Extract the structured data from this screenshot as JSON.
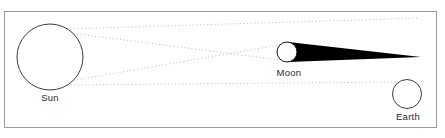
{
  "figure": {
    "background_color": "#ffffff",
    "frame_color": "#9a9a9a",
    "width": 445,
    "height": 138
  },
  "labels": {
    "sun": "Sun",
    "moon": "Moon",
    "earth": "Earth"
  },
  "bodies": [
    {
      "key": "sun",
      "label": "Sun",
      "shape": "circle",
      "cx": 50,
      "cy": 57,
      "r": 33,
      "fill": "#ffffff",
      "stroke": "#3c3c3c",
      "label_x": 50,
      "label_y": 101
    },
    {
      "key": "moon",
      "label": "Moon",
      "shape": "circle",
      "cx": 287,
      "cy": 52,
      "r": 10,
      "fill": "#ffffff",
      "stroke": "#111111",
      "label_x": 289,
      "label_y": 76
    },
    {
      "key": "earth",
      "label": "Earth",
      "shape": "circle",
      "cx": 407,
      "cy": 94,
      "r": 14.5,
      "fill": "#ffffff",
      "stroke": "#3c3c3c",
      "label_x": 408,
      "label_y": 120
    }
  ],
  "umbra": {
    "name": "moon-shadow-cone",
    "fill": "#000000",
    "apex_x": 421,
    "apex_y": 57,
    "base_top_x": 288,
    "base_top_y": 42,
    "base_bottom_x": 288,
    "base_bottom_y": 62
  },
  "rays": {
    "style": "dotted",
    "color": "#b9b9b9",
    "dash": "1,2.6",
    "width": 1,
    "lines": [
      {
        "name": "penumbra-ray-upper-outer",
        "x1": 67,
        "y1": 29,
        "x2": 420,
        "y2": 18
      },
      {
        "name": "umbra-ray-upper",
        "x1": 70,
        "y1": 33,
        "x2": 296,
        "y2": 62
      },
      {
        "name": "umbra-ray-lower",
        "x1": 70,
        "y1": 81,
        "x2": 296,
        "y2": 42
      },
      {
        "name": "penumbra-ray-lower-outer",
        "x1": 67,
        "y1": 85,
        "x2": 396,
        "y2": 82
      }
    ]
  },
  "frame": {
    "x": 4.5,
    "y": 11.5,
    "width": 432,
    "height": 116,
    "stroke": "#9a9a9a",
    "fill": "none"
  }
}
